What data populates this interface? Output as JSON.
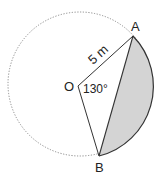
{
  "diagram": {
    "points": {
      "center": "O",
      "a": "A",
      "b": "B"
    },
    "radius_label": "5 m",
    "angle_label": "130°",
    "colors": {
      "stroke": "#333333",
      "dotted_circle": "#888888",
      "segment_fill": "#d4d4d4"
    }
  }
}
